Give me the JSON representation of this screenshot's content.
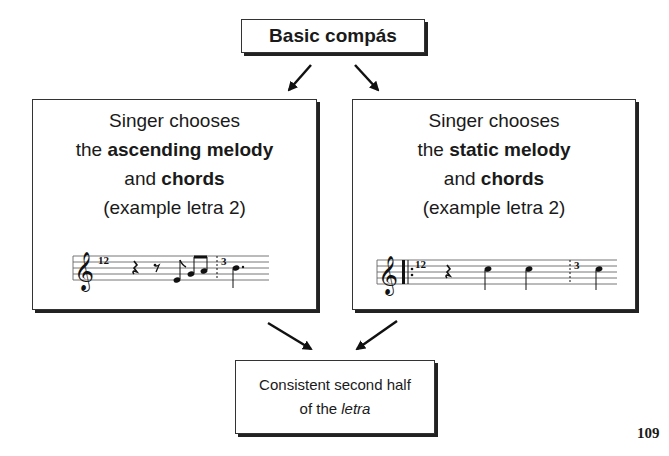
{
  "diagram": {
    "top_node": {
      "label": "Basic compás"
    },
    "left_node": {
      "line1": "Singer chooses",
      "line2_prefix": "the ",
      "line2_bold": "ascending melody",
      "line3_prefix": "and ",
      "line3_bold": "chords",
      "line4": "(example letra 2)",
      "notation": {
        "measure_start": "12",
        "measure_next": "3",
        "description": "treble clef, quarter rest, eighth rest, eighth note E, beamed eighths G A, dotted barline, dotted quarter B"
      }
    },
    "right_node": {
      "line1": "Singer chooses",
      "line2_prefix": "the ",
      "line2_bold": "static melody",
      "line3_prefix": "and ",
      "line3_bold": "chords",
      "line4": "(example letra 2)",
      "notation": {
        "measure_start": "12",
        "measure_next": "3",
        "description": "treble clef, repeat start barline, quarter rest, quarter D, quarter D, dotted barline, quarter D"
      }
    },
    "bottom_node": {
      "line1": "Consistent second half",
      "line2_prefix": "of the ",
      "line2_italic": "letra"
    },
    "edges": [
      {
        "from": "top_node",
        "to": "left_node"
      },
      {
        "from": "top_node",
        "to": "right_node"
      },
      {
        "from": "left_node",
        "to": "bottom_node"
      },
      {
        "from": "right_node",
        "to": "bottom_node"
      }
    ]
  },
  "page": {
    "number": "109"
  }
}
